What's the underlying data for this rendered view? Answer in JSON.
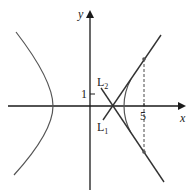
{
  "axes": {
    "x_label": "x",
    "y_label": "y",
    "x_tick_label": "5",
    "y_tick_label": "1"
  },
  "lines": {
    "l1_label": "L",
    "l1_sub": "1",
    "l2_label": "L",
    "l2_sub": "2"
  },
  "colors": {
    "axis": "#1a1a1a",
    "curve": "#555555",
    "line": "#333333"
  }
}
